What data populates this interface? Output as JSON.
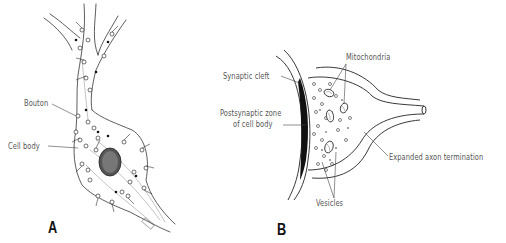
{
  "figure": {
    "panels": [
      {
        "id": "A",
        "letter": "A",
        "subject": "neuron-cell-body-with-boutons",
        "labels": {
          "bouton": "Bouton",
          "cell_body": "Cell body"
        },
        "signature": "PERRY"
      },
      {
        "id": "B",
        "letter": "B",
        "subject": "synapse-detail",
        "labels": {
          "synaptic_cleft": "Synaptic cleft",
          "postsynaptic_zone_line1": "Postsynaptic zone",
          "postsynaptic_zone_line2": "of cell body",
          "mitochondria": "Mitochondria",
          "expanded_axon_termination": "Expanded axon termination",
          "vesicles": "Vesicles"
        }
      }
    ],
    "colors": {
      "ink": "#222222",
      "label_text": "#555555",
      "background": "#ffffff"
    }
  }
}
